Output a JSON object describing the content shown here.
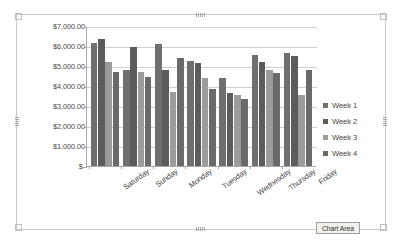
{
  "chart_data": {
    "type": "bar",
    "title": "",
    "xlabel": "",
    "ylabel": "",
    "grid": true,
    "legend_position": "right",
    "ylim": [
      0,
      7000
    ],
    "ytick_values": [
      7000,
      6000,
      5000,
      4000,
      3000,
      2000,
      1000,
      0
    ],
    "ytick_labels": [
      "$7,000.00",
      "$6,000.00",
      "$5,000.00",
      "$4,000.00",
      "$3,000.00",
      "$2,000.00",
      "$1,000.00",
      "$-"
    ],
    "categories": [
      "Saturday",
      "Sunday",
      "Monday",
      "Tuesday",
      "Wednesday",
      "Thursday",
      "Friday"
    ],
    "series": [
      {
        "name": "Week 1",
        "color": "#6f6f6f",
        "values": [
          6150,
          4800,
          6100,
          5250,
          4400,
          5550,
          5650
        ]
      },
      {
        "name": "Week 2",
        "color": "#5c5c5c",
        "values": [
          6350,
          5950,
          4800,
          5150,
          3650,
          5200,
          5500
        ]
      },
      {
        "name": "Week 3",
        "color": "#9b9b9b",
        "values": [
          5200,
          4700,
          3700,
          4400,
          3550,
          4800,
          3550
        ]
      },
      {
        "name": "Week 4",
        "color": "#6a6a6a",
        "values": [
          4700,
          4450,
          5400,
          3850,
          3350,
          4650,
          4800
        ]
      }
    ]
  },
  "legend": {
    "items": [
      {
        "label": "Week 1"
      },
      {
        "label": "Week 2"
      },
      {
        "label": "Week 3"
      },
      {
        "label": "Week 4"
      }
    ]
  },
  "tooltip": {
    "chart_area_label": "Chart Area"
  }
}
